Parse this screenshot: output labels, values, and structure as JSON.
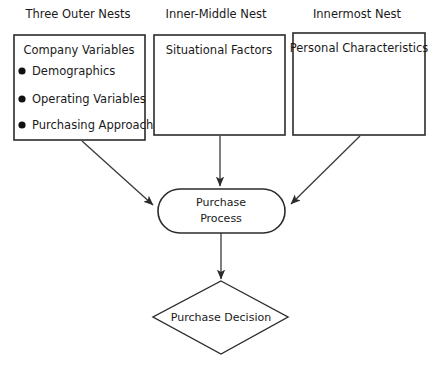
{
  "diagram": {
    "background_color": "#ffffff",
    "line_color": "#2b2b2b",
    "text_color": "#1a1a1a",
    "headers": [
      {
        "label": "Three Outer Nests"
      },
      {
        "label": "Inner-Middle Nest"
      },
      {
        "label": "Innermost Nest"
      }
    ],
    "boxes": [
      {
        "title": "Company Variables",
        "bullets": [
          "Demographics",
          "Operating Variables",
          "Purchasing Approach"
        ]
      },
      {
        "title": "Situational Factors",
        "bullets": []
      },
      {
        "title": "Personal Characteristics",
        "bullets": []
      }
    ],
    "process_node": {
      "shape": "stadium",
      "line1": "Purchase",
      "line2": "Process"
    },
    "decision_node": {
      "shape": "diamond",
      "label": "Purchase Decision"
    },
    "connectors": [
      {
        "from": "Company Variables",
        "to": "Purchase Process",
        "style": "diagonal-arrow"
      },
      {
        "from": "Situational Factors",
        "to": "Purchase Process",
        "style": "vertical-arrow"
      },
      {
        "from": "Personal Characteristics",
        "to": "Purchase Process",
        "style": "diagonal-arrow"
      },
      {
        "from": "Purchase Process",
        "to": "Purchase Decision",
        "style": "vertical-arrow"
      }
    ]
  }
}
